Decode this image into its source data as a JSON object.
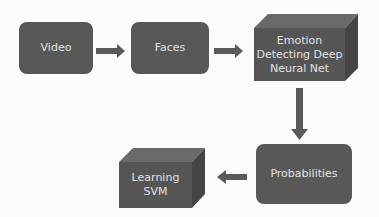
{
  "diagram": {
    "nodes": [
      {
        "id": "video",
        "label": "Video",
        "shape": "rounded-rect"
      },
      {
        "id": "faces",
        "label": "Faces",
        "shape": "rounded-rect"
      },
      {
        "id": "dnn",
        "label": "Emotion Detecting Deep Neural Net",
        "label_lines": [
          "Emotion",
          "Detecting Deep",
          "Neural Net"
        ],
        "shape": "3d-box"
      },
      {
        "id": "probabilities",
        "label": "Probabilities",
        "shape": "rounded-rect"
      },
      {
        "id": "svm",
        "label": "Learning SVM",
        "label_lines": [
          "Learning",
          "SVM"
        ],
        "shape": "3d-box"
      }
    ],
    "edges": [
      {
        "from": "video",
        "to": "faces",
        "direction": "right"
      },
      {
        "from": "faces",
        "to": "dnn",
        "direction": "right"
      },
      {
        "from": "dnn",
        "to": "probabilities",
        "direction": "down"
      },
      {
        "from": "probabilities",
        "to": "svm",
        "direction": "left"
      }
    ],
    "colors": {
      "box_fill": "#555555",
      "box_top": "#6a6a6a",
      "box_side": "#444444",
      "text": "#e2e2e2",
      "arrow": "#5a5a5a",
      "background": "#fbfbfb"
    }
  }
}
